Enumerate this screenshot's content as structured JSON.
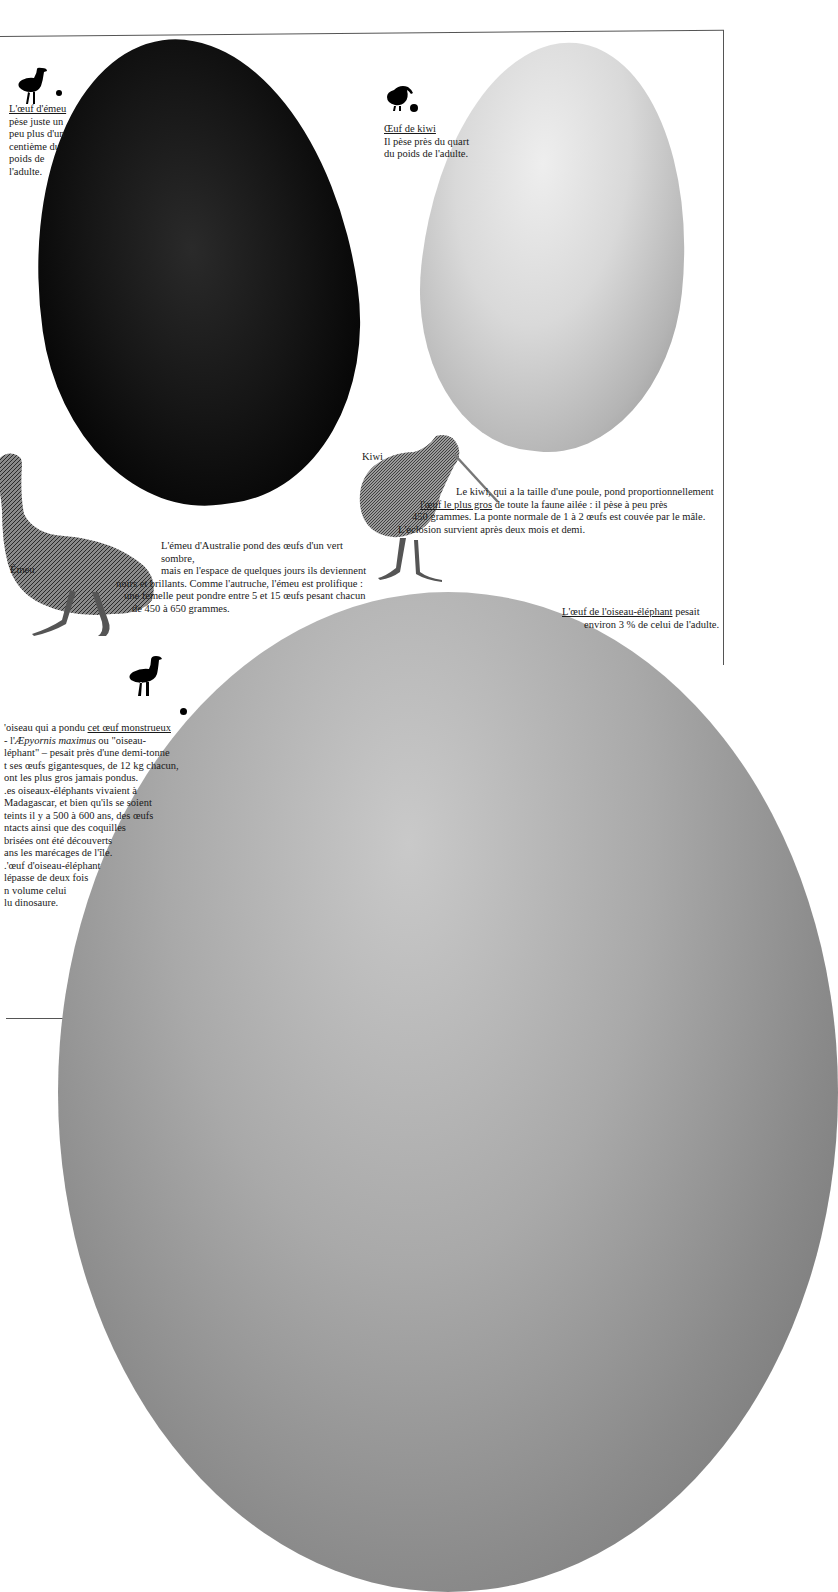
{
  "page": {
    "background": "#ffffff",
    "rule_color": "#555555"
  },
  "emu_caption": {
    "link": "L'œuf d'émeu",
    "lines": [
      "pèse juste un",
      "peu plus d'un",
      "centième du",
      "poids de",
      "l'adulte."
    ]
  },
  "kiwi_caption": {
    "link": "Œuf de kiwi",
    "lines": [
      "Il pèse près du quart",
      "du poids de l'adulte."
    ]
  },
  "kiwi_label": "Kiwi",
  "kiwi_paragraph": {
    "line1": "Le kiwi, qui a la taille d'une poule, pond proportionnellement",
    "line2_link": "l'œuf le plus gros",
    "line2_rest": " de toute la faune ailée : il pèse à peu près",
    "line3": "450 grammes. La ponte normale de 1 à 2 œufs est couvée par le mâle.",
    "line4": "L'éclosion survient après deux mois et demi."
  },
  "emu_label": "Émeu",
  "emu_paragraph": {
    "lines": [
      "L'émeu d'Australie pond des œufs d'un vert sombre,",
      "mais en l'espace de quelques jours ils deviennent",
      "noirs et brillants. Comme l'autruche, l'émeu est prolifique :",
      "une femelle peut pondre entre 5 et 15 œufs pesant chacun",
      "de 450 à 650 grammes."
    ]
  },
  "elephant_caption": {
    "link": "L'œuf de l'oiseau-éléphant",
    "rest": " pesait",
    "line2": "environ 3 % de celui de l'adulte."
  },
  "elephant_paragraph": {
    "line1_pre": "'oiseau qui a pondu ",
    "line1_link": "cet œuf monstrueux",
    "line2_pre": "- l'",
    "line2_italic": "Æpyornis maximus",
    "line2_rest": "  ou \"oiseau-",
    "lines": [
      "léphant\" – pesait près d'une demi-tonne",
      "t ses œufs gigantesques, de 12 kg chacun,",
      "ont les plus gros jamais pondus.",
      ".es oiseaux-éléphants vivaient à",
      "Madagascar, et bien qu'ils se soient",
      "teints il y a 500 à 600 ans, des œufs",
      "ntacts ainsi que des coquilles",
      "brisées ont été découverts",
      "ans les marécages de l'île.",
      ".'œuf d'oiseau-éléphant",
      "lépasse de deux fois",
      "n volume celui",
      "lu dinosaure."
    ]
  },
  "icons": {
    "emu_silhouette": "emu-silhouette-icon",
    "kiwi_silhouette": "kiwi-silhouette-icon",
    "elephant_bird_silhouette": "elephant-bird-silhouette-icon"
  }
}
